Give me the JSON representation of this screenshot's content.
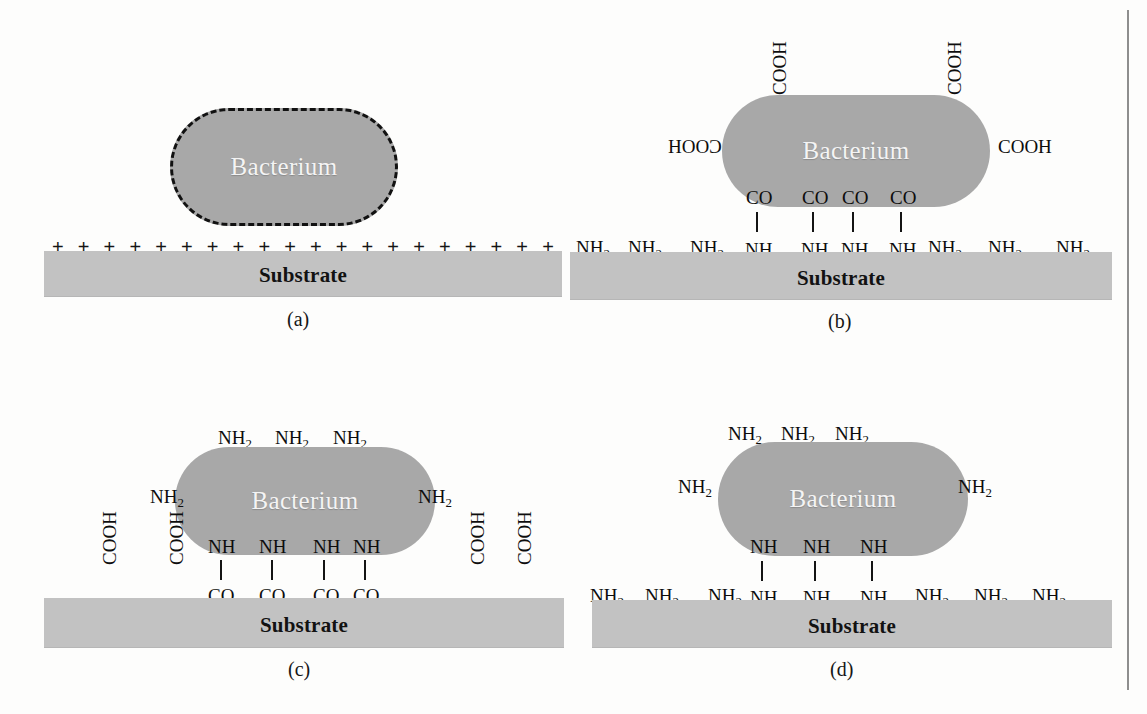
{
  "figure": {
    "background_color": "#fdfdfc",
    "bacterium_color": "#a8a8a8",
    "substrate_color": "#c2c2c2",
    "bacterium_text_color": "#f4f4f4",
    "ink_color": "#0d0d0d"
  },
  "labels": {
    "bacterium": "Bacterium",
    "substrate": "Substrate",
    "cooh": "COOH",
    "hooc": "HOOC",
    "co": "CO",
    "nh": "NH",
    "nh2_text": "NH",
    "nh2_sub": "2",
    "plus": "+"
  },
  "panels": [
    {
      "id": "a",
      "caption": "(a)",
      "bacterium_label": "Bacterium",
      "substrate_label": "Substrate",
      "bacterium_outline": "dashed",
      "surface_charges": [
        "+",
        "+",
        "+",
        "+",
        "+",
        "+",
        "+",
        "+",
        "+",
        "+",
        "+",
        "+",
        "+",
        "+",
        "+",
        "+",
        "+",
        "+",
        "+",
        "+"
      ],
      "charge_count": 20,
      "bacterium_top_groups": [],
      "bacterium_side_groups": [],
      "bacterium_bottom_groups": [],
      "substrate_groups": [],
      "bonds": 0
    },
    {
      "id": "b",
      "caption": "(b)",
      "bacterium_label": "Bacterium",
      "substrate_label": "Substrate",
      "bacterium_outline": "none",
      "bacterium_top_groups": [
        "COOH",
        "COOH"
      ],
      "bacterium_left_group": "HOOC",
      "bacterium_right_group": "COOH",
      "bacterium_bottom_groups": [
        "CO",
        "CO",
        "CO",
        "CO"
      ],
      "substrate_bonded_groups": [
        "NH",
        "NH",
        "NH",
        "NH"
      ],
      "substrate_left_groups": [
        "NH2",
        "NH2",
        "NH2"
      ],
      "substrate_right_groups": [
        "NH2",
        "NH2",
        "NH2"
      ],
      "bonds": 4
    },
    {
      "id": "c",
      "caption": "(c)",
      "bacterium_label": "Bacterium",
      "substrate_label": "Substrate",
      "bacterium_outline": "none",
      "bacterium_top_groups": [
        "NH2",
        "NH2",
        "NH2"
      ],
      "bacterium_left_group": "NH2",
      "bacterium_right_group": "NH2",
      "bacterium_bottom_groups": [
        "NH",
        "NH",
        "NH",
        "NH"
      ],
      "substrate_bonded_groups": [
        "CO",
        "CO",
        "CO",
        "CO"
      ],
      "substrate_left_groups": [
        "COOH",
        "COOH"
      ],
      "substrate_right_groups": [
        "COOH",
        "COOH"
      ],
      "bonds": 4
    },
    {
      "id": "d",
      "caption": "(d)",
      "bacterium_label": "Bacterium",
      "substrate_label": "Substrate",
      "bacterium_outline": "none",
      "bacterium_top_groups": [
        "NH2",
        "NH2",
        "NH2"
      ],
      "bacterium_left_group": "NH2",
      "bacterium_right_group": "NH2",
      "bacterium_bottom_groups": [
        "NH",
        "NH",
        "NH"
      ],
      "substrate_bonded_groups": [
        "NH",
        "NH",
        "NH"
      ],
      "substrate_left_groups": [
        "NH2",
        "NH2",
        "NH2"
      ],
      "substrate_right_groups": [
        "NH2",
        "NH2",
        "NH2"
      ],
      "bonds": 3
    }
  ]
}
